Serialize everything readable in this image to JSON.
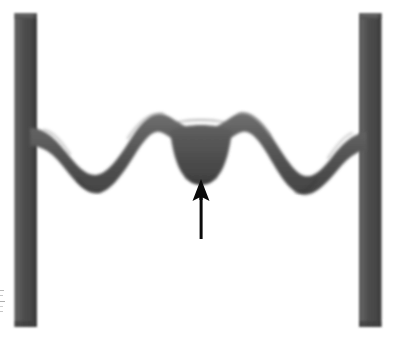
{
  "figure": {
    "domain_kind": "grayscale-micrograph",
    "title": "Suspended wavy ridge between two vertical pillars",
    "background_color": "#ffffff",
    "width": 393,
    "height": 346,
    "annotation_caption": "",
    "edge_marks_label": "cropped edge marks"
  },
  "colors": {
    "background": "#ffffff",
    "structure_dark": "#4b4b4b",
    "structure_mid": "#5a5a5a",
    "structure_light": "#6e6e6e",
    "structure_shadow": "#3c3c3c",
    "pillar_dark": "#4a4a4a",
    "pillar_light": "#616161",
    "arrow": "#0a0a0a",
    "edge_mark": "#b9b9b9"
  },
  "pillars": [
    {
      "name": "left-pillar",
      "x": 14,
      "y": 13,
      "width": 23,
      "height": 314,
      "top_y": 13,
      "bottom_y": 327
    },
    {
      "name": "right-pillar",
      "x": 359,
      "y": 13,
      "width": 23,
      "height": 314,
      "top_y": 13,
      "bottom_y": 327
    }
  ],
  "ridge": {
    "name": "wavy-ridge",
    "attach_left_x": 37,
    "attach_left_y": 140,
    "attach_right_x": 359,
    "attach_right_y": 140,
    "band_thickness": 18,
    "top_path_points": [
      [
        37,
        131
      ],
      [
        52,
        136
      ],
      [
        68,
        152
      ],
      [
        84,
        170
      ],
      [
        96,
        174
      ],
      [
        112,
        163
      ],
      [
        128,
        140
      ],
      [
        144,
        120
      ],
      [
        158,
        114
      ],
      [
        172,
        119
      ],
      [
        182,
        126
      ],
      [
        196,
        128
      ],
      [
        210,
        128
      ],
      [
        224,
        126
      ],
      [
        236,
        119
      ],
      [
        248,
        114
      ],
      [
        262,
        118
      ],
      [
        278,
        139
      ],
      [
        294,
        162
      ],
      [
        308,
        174
      ],
      [
        322,
        172
      ],
      [
        336,
        156
      ],
      [
        348,
        142
      ],
      [
        359,
        133
      ]
    ],
    "central_notch": {
      "name": "central-notch",
      "apex_x": 201,
      "apex_y": 177,
      "left_x": 170,
      "right_x": 233,
      "depth": 49,
      "description": "downward protrusion at the centre of the ridge"
    },
    "troughs": [
      {
        "name": "left-trough",
        "x": 92,
        "y": 186
      },
      {
        "name": "right-trough",
        "x": 305,
        "y": 187
      }
    ],
    "crests": [
      {
        "name": "left-crest",
        "x": 150,
        "y": 112
      },
      {
        "name": "centre-plateau",
        "x": 201,
        "y": 126
      },
      {
        "name": "right-crest",
        "x": 250,
        "y": 112
      }
    ]
  },
  "arrow": {
    "name": "pointer-arrow",
    "direction": "up",
    "tip_x": 201,
    "tip_y": 179,
    "tail_x": 201,
    "tail_y": 238,
    "head_width": 15,
    "head_height": 20,
    "shaft_width": 3,
    "color": "#0a0a0a",
    "points_at": "central-notch"
  }
}
